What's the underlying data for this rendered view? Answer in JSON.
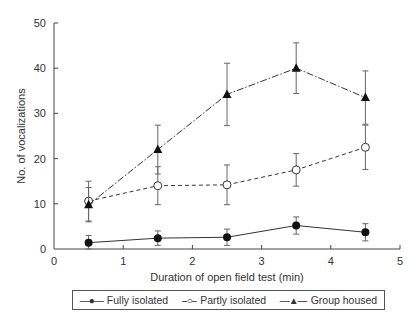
{
  "chart_data": {
    "type": "line",
    "title": "",
    "xlabel": "Duration of open field test (min)",
    "ylabel": "No. of vocalizations",
    "xlim": [
      0,
      5
    ],
    "ylim": [
      0,
      50
    ],
    "xticks": [
      0,
      1,
      2,
      3,
      4,
      5
    ],
    "yticks": [
      0,
      10,
      20,
      30,
      40,
      50
    ],
    "grid": false,
    "legend_position": "bottom (boxed, below x-axis)",
    "x": [
      0.5,
      1.5,
      2.5,
      3.5,
      4.5
    ],
    "series": [
      {
        "name": "Fully isolated",
        "marker": "filled-circle",
        "line_style": "solid",
        "values": [
          1.4,
          2.4,
          2.6,
          5.2,
          3.7
        ],
        "error": [
          1.6,
          1.6,
          1.8,
          1.9,
          1.9
        ]
      },
      {
        "name": "Partly isolated",
        "marker": "open-circle",
        "line_style": "dashed",
        "values": [
          10.6,
          14.0,
          14.2,
          17.5,
          22.5
        ],
        "error": [
          4.4,
          4.2,
          4.4,
          3.6,
          4.9
        ]
      },
      {
        "name": "Group housed",
        "marker": "filled-triangle",
        "line_style": "dash-dot",
        "values": [
          9.8,
          22.0,
          34.2,
          40.0,
          33.5
        ],
        "error": [
          3.8,
          5.4,
          6.9,
          5.6,
          5.9
        ]
      }
    ]
  },
  "legend": {
    "items": [
      {
        "symbol": "—●—",
        "label": "Fully isolated"
      },
      {
        "symbol": "--○--",
        "label": "Partly isolated"
      },
      {
        "symbol": "—▲—",
        "label": "Group housed"
      }
    ]
  }
}
